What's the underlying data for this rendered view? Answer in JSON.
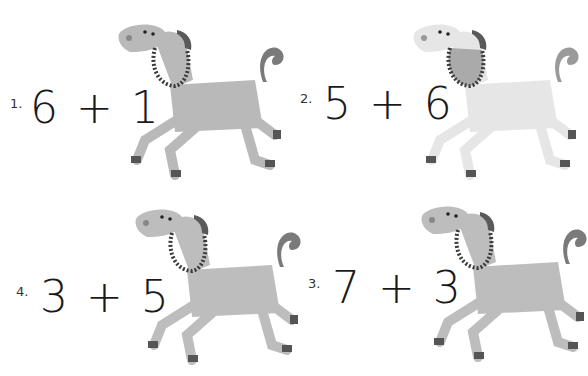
{
  "worksheet": {
    "problems": [
      {
        "number": "1.",
        "equation": "6 + 1 =",
        "horse_color": "#b9b9b9"
      },
      {
        "number": "2.",
        "equation": "5 + 6 =",
        "horse_color": "#e6e6e6"
      },
      {
        "number": "4.",
        "equation": "3 + 5 =",
        "horse_color": "#bdbdbd"
      },
      {
        "number": "3.",
        "equation": "7 + 3 =",
        "horse_color": "#bdbdbd"
      }
    ],
    "icons": {
      "horse": "horse-illustration"
    }
  }
}
